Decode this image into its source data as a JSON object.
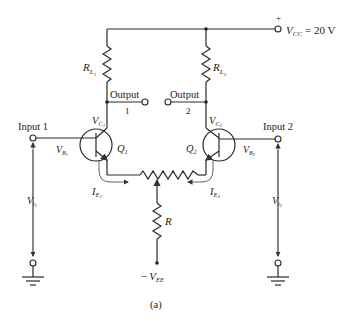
{
  "figure": {
    "caption": "(a)",
    "type": "differential amplifier circuit"
  },
  "supply": {
    "plus_sign": "+",
    "vcc_symbol": "V",
    "vcc_sub": "CC",
    "vcc_value": "= 20 V",
    "vee_minus": "−",
    "vee_symbol": "V",
    "vee_sub": "EE"
  },
  "components": {
    "rl1": {
      "symbol": "R",
      "sub": "L",
      "subsub": "1"
    },
    "rl2": {
      "symbol": "R",
      "sub": "L",
      "subsub": "2"
    },
    "r": {
      "symbol": "R"
    },
    "q1": {
      "symbol": "Q",
      "sub": "1"
    },
    "q2": {
      "symbol": "Q",
      "sub": "2"
    }
  },
  "nodes": {
    "output1": {
      "label": "Output",
      "number": "1"
    },
    "output2": {
      "label": "Output",
      "number": "2"
    },
    "input1": {
      "label": "Input 1"
    },
    "input2": {
      "label": "Input 2"
    },
    "vc1": {
      "symbol": "V",
      "sub": "C",
      "subsub": "1"
    },
    "vc2": {
      "symbol": "V",
      "sub": "C",
      "subsub": "2"
    },
    "vb1": {
      "symbol": "V",
      "sub": "B",
      "subsub": "1"
    },
    "vb2": {
      "symbol": "V",
      "sub": "B",
      "subsub": "2"
    },
    "vi1": {
      "symbol": "V",
      "sub": "i",
      "subsub": "1"
    },
    "vi2": {
      "symbol": "V",
      "sub": "i",
      "subsub": "2"
    },
    "ie1": {
      "symbol": "I",
      "sub": "E",
      "subsub": "1"
    },
    "ie2": {
      "symbol": "I",
      "sub": "E",
      "subsub": "2"
    }
  }
}
